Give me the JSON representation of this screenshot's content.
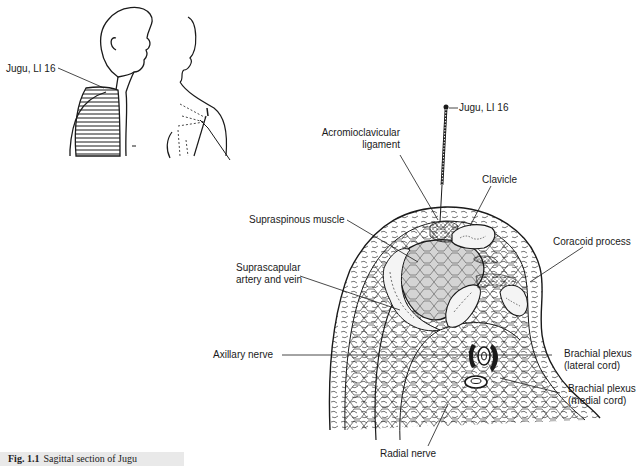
{
  "figure": {
    "caption_number": "Fig. 1.1",
    "caption_text": "Sagittal section of Jugu"
  },
  "overview_figure": {
    "label": "Jugu, LI 16"
  },
  "section_figure": {
    "needle_label": "Jugu, LI 16",
    "labels": {
      "acromioclavicular_line1": "Acromioclavicular",
      "acromioclavicular_line2": "ligament",
      "clavicle": "Clavicle",
      "supraspinous": "Supraspinous muscle",
      "coracoid": "Coracoid process",
      "suprascapular_line1": "Suprascapular",
      "suprascapular_line2": "artery and vein",
      "axillary": "Axillary nerve",
      "bp_lateral_line1": "Brachial plexus",
      "bp_lateral_line2": "(lateral cord)",
      "bp_medial_line1": "Brachial plexus",
      "bp_medial_line2": "(medial cord)",
      "radial": "Radial nerve"
    }
  },
  "colors": {
    "ink": "#1a1a1a",
    "muscle_fill": "#d4d4d4",
    "bone_fill": "#f4f4f4",
    "caption_bg": "#e9e9e9"
  }
}
